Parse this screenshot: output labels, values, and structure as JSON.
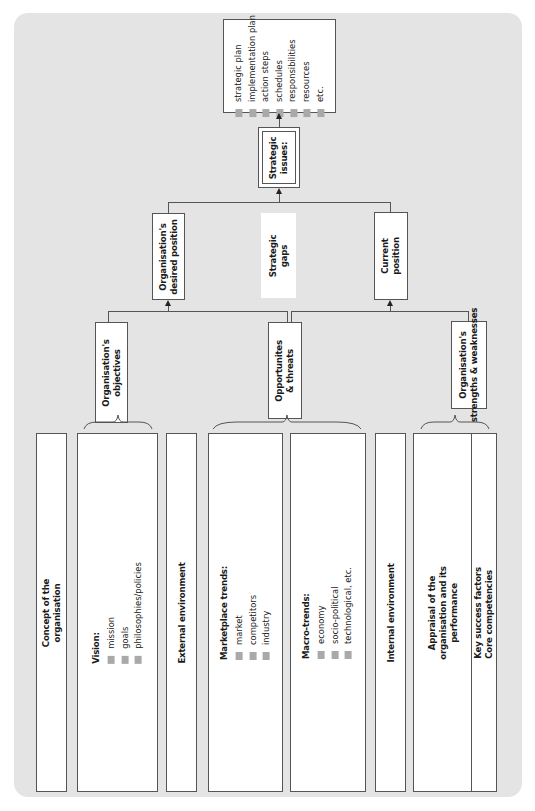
{
  "diagram": {
    "orientation": "rotated 90 degrees counter-clockwise",
    "outputs_box": {
      "items": [
        "strategic plan",
        "implementation plan",
        "action steps",
        "schedules",
        "responsibilities",
        "resources",
        "etc."
      ]
    },
    "strategic_issues": {
      "label_line1": "Strategic",
      "label_line2": "issues:"
    },
    "desired_position": {
      "label_line1": "Organisation's",
      "label_line2": "desired position"
    },
    "strategic_gaps": {
      "label_line1": "Strategic",
      "label_line2": "gaps"
    },
    "current_position": {
      "label_line1": "Current",
      "label_line2": "position"
    },
    "objectives": {
      "label_line1": "Organisation's",
      "label_line2": "objectives"
    },
    "opportunities": {
      "label_line1": "Opportunites",
      "label_line2": "& threats"
    },
    "strengths": {
      "label_line1": "Organisation's",
      "label_line2": "strengths & weaknesses"
    },
    "concept": {
      "label_line1": "Concept of the",
      "label_line2": "organisation"
    },
    "vision": {
      "heading": "Vision:",
      "items": [
        "mission",
        "goals",
        "philosophies/policies"
      ]
    },
    "external_environment": {
      "label": "External environment"
    },
    "marketplace_trends": {
      "heading": "Marketplace trends:",
      "items": [
        "market",
        "competitors",
        "industry"
      ]
    },
    "macro_trends": {
      "heading": "Macro-trends:",
      "items": [
        "economy",
        "socio-political",
        "technological, etc."
      ]
    },
    "internal_environment": {
      "label": "Internal environment"
    },
    "appraisal": {
      "label_line1": "Appraisal of the",
      "label_line2": "organisation and its",
      "label_line3": "performance"
    },
    "key_factors": {
      "label_line1": "Key success factors",
      "label_line2": "Core competencies"
    },
    "colors": {
      "panel": "#e4e4e4",
      "box": "#ffffff",
      "border": "#555555",
      "bullet": "#a9a9a9"
    }
  }
}
